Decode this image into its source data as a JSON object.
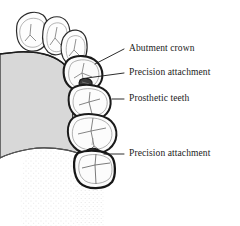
{
  "figure": {
    "width": 240,
    "height": 226,
    "background_color": "#ffffff",
    "ink_color": "#1a1a1a",
    "gum_fill_color": "#d8d8d8",
    "tooth_fill_color": "#fdfdfd",
    "stipple_color": "#e9e9e9",
    "attachment_color": "#3a3a3a"
  },
  "labels": [
    {
      "id": "abutment-crown",
      "text": "Abutment crown",
      "x": 129,
      "y": 44,
      "leader": {
        "x1": 124,
        "y1": 49,
        "x2": 95,
        "y2": 64
      }
    },
    {
      "id": "precision-attachment-upper",
      "text": "Precision attachment",
      "x": 129,
      "y": 68,
      "leader": {
        "x1": 124,
        "y1": 73,
        "x2": 87,
        "y2": 78
      }
    },
    {
      "id": "prosthetic-teeth",
      "text": "Prosthetic teeth",
      "x": 129,
      "y": 94,
      "leader": {
        "x1": 124,
        "y1": 99,
        "x2": 112,
        "y2": 99
      }
    },
    {
      "id": "precision-attachment-lower",
      "text": "Precision attachment",
      "x": 129,
      "y": 149,
      "leader": {
        "x1": 124,
        "y1": 154,
        "x2": 104,
        "y2": 154
      }
    }
  ],
  "anatomy": {
    "natural_teeth": [
      {
        "id": "natural-tooth-1",
        "name": "natural tooth cusp (distal)"
      },
      {
        "id": "natural-tooth-2",
        "name": "natural tooth cusp (middle)"
      },
      {
        "id": "natural-tooth-3",
        "name": "natural tooth cusp (mesial)"
      }
    ],
    "bridge_units": [
      {
        "id": "abutment-crown-unit",
        "name": "abutment crown"
      },
      {
        "id": "pontic-unit-1",
        "name": "prosthetic tooth (pontic 1)"
      },
      {
        "id": "pontic-unit-2",
        "name": "prosthetic tooth (pontic 2)"
      },
      {
        "id": "terminal-unit",
        "name": "prosthetic tooth (terminal)"
      }
    ],
    "attachments": [
      {
        "id": "attachment-upper",
        "name": "precision attachment (upper)"
      },
      {
        "id": "attachment-lower",
        "name": "precision attachment (lower)"
      }
    ],
    "ridge": {
      "id": "alveolar-ridge",
      "name": "alveolar ridge / gingiva"
    },
    "mucosa": {
      "id": "stippled-mucosa",
      "name": "stippled mucosa"
    }
  }
}
